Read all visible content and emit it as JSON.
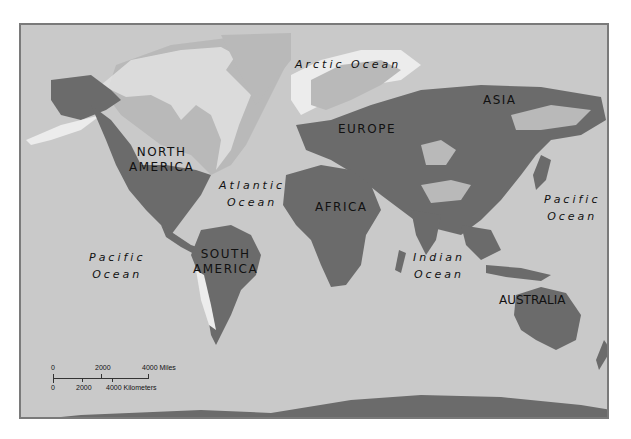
{
  "map": {
    "title": "World map",
    "colors": {
      "ocean": "#c9c9c9",
      "land_range": "#6b6b6b",
      "land_other": "#b9b9b9",
      "ice": "#ececec",
      "frame": "#7a7a7a"
    },
    "continents": [
      {
        "id": "north-america",
        "line1": "NORTH",
        "line2": "AMERICA"
      },
      {
        "id": "south-america",
        "line1": "SOUTH",
        "line2": "AMERICA"
      },
      {
        "id": "europe",
        "line1": "EUROPE"
      },
      {
        "id": "africa",
        "line1": "AFRICA"
      },
      {
        "id": "asia",
        "line1": "ASIA"
      },
      {
        "id": "australia",
        "line1": "AUSTRALIA"
      }
    ],
    "oceans": [
      {
        "id": "arctic",
        "line1": "Arctic Ocean"
      },
      {
        "id": "atlantic",
        "line1": "Atlantic",
        "line2": "Ocean"
      },
      {
        "id": "pacific-west",
        "line1": "Pacific",
        "line2": "Ocean"
      },
      {
        "id": "pacific-east",
        "line1": "Pacific",
        "line2": "Ocean"
      },
      {
        "id": "indian",
        "line1": "Indian",
        "line2": "Ocean"
      }
    ],
    "scale_bar": {
      "miles": {
        "ticks": [
          "0",
          "2000",
          "4000 Miles"
        ]
      },
      "kilometers": {
        "ticks": [
          "0",
          "2000",
          "4000 Kilometers"
        ]
      }
    }
  }
}
